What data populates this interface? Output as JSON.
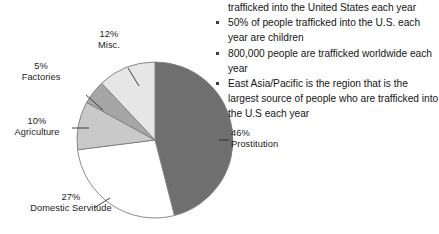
{
  "chart_data": {
    "type": "pie",
    "title": "",
    "legend_position": "callout-labels",
    "categories": [
      "Prostitution",
      "Domestic Servitude",
      "Agriculture",
      "Factories",
      "Misc."
    ],
    "values": [
      46,
      27,
      10,
      5,
      12
    ],
    "value_suffix": "%",
    "slices": [
      {
        "label": "Prostitution",
        "value": 46,
        "value_text": "46%",
        "color": "#6f6f6f",
        "start_deg": 0,
        "end_deg": 165.6
      },
      {
        "label": "Domestic Servitude",
        "value": 27,
        "value_text": "27%",
        "color": "#ffffff",
        "start_deg": 165.6,
        "end_deg": 262.8
      },
      {
        "label": "Agriculture",
        "value": 10,
        "value_text": "10%",
        "color": "#c9c9c9",
        "start_deg": 262.8,
        "end_deg": 298.8
      },
      {
        "label": "Factories",
        "value": 5,
        "value_text": "5%",
        "color": "#a6a6a6",
        "start_deg": 298.8,
        "end_deg": 316.8
      },
      {
        "label": "Misc.",
        "value": 12,
        "value_text": "12%",
        "color": "#e6e6e6",
        "start_deg": 316.8,
        "end_deg": 360
      }
    ],
    "stroke_color": "#7d7d7d"
  },
  "labels": {
    "misc": {
      "percent": "12%",
      "category": "Misc."
    },
    "factories": {
      "percent": "5%",
      "category": "Factories"
    },
    "agriculture": {
      "percent": "10%",
      "category": "Agriculture"
    },
    "domestic": {
      "percent": "27%",
      "category": "Domestic Servitude"
    },
    "prostitution": {
      "percent": "46%",
      "category": "Prostitution"
    }
  },
  "bullets": {
    "orphan_line": "trafficked into the United States each year",
    "items": [
      "50% of people trafficked into the U.S. each year are children",
      "800,000 people are trafficked worldwide each year",
      "East Asia/Pacific is the region that is the largest source of people who are trafficked into the U.S each year"
    ]
  }
}
